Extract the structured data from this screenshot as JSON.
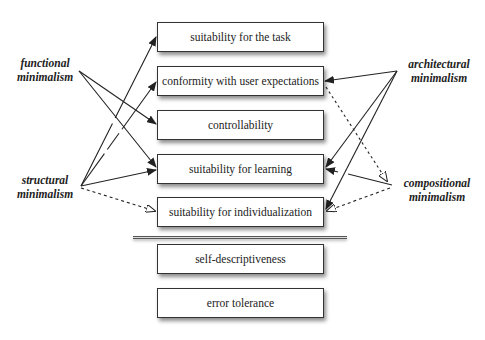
{
  "criteria": [
    {
      "id": "task",
      "label": "suitability for the task"
    },
    {
      "id": "conformity",
      "label": "conformity with user expectations"
    },
    {
      "id": "controllability",
      "label": "controllability"
    },
    {
      "id": "learning",
      "label": "suitability for learning"
    },
    {
      "id": "individualization",
      "label": "suitability for individualization"
    },
    {
      "id": "self_descriptiveness",
      "label": "self-descriptiveness"
    },
    {
      "id": "error_tolerance",
      "label": "error tolerance"
    }
  ],
  "minimalism_types": {
    "functional": {
      "line1": "functional",
      "line2": "minimalism"
    },
    "structural": {
      "line1": "structural",
      "line2": "minimalism"
    },
    "architectural": {
      "line1": "architectural",
      "line2": "minimalism"
    },
    "compositional": {
      "line1": "compositional",
      "line2": "minimalism"
    }
  },
  "relations": [
    {
      "from": "functional minimalism",
      "to": "controllability",
      "style": "solid"
    },
    {
      "from": "functional minimalism",
      "to": "suitability for learning",
      "style": "solid"
    },
    {
      "from": "structural minimalism",
      "to": "suitability for the task",
      "style": "solid"
    },
    {
      "from": "structural minimalism",
      "to": "conformity with user expectations",
      "style": "solid"
    },
    {
      "from": "structural minimalism",
      "to": "suitability for learning",
      "style": "solid"
    },
    {
      "from": "structural minimalism",
      "to": "suitability for individualization",
      "style": "dashed-hollow"
    },
    {
      "from": "architectural minimalism",
      "to": "conformity with user expectations",
      "style": "solid"
    },
    {
      "from": "architectural minimalism",
      "to": "suitability for learning",
      "style": "solid"
    },
    {
      "from": "architectural minimalism",
      "to": "suitability for individualization",
      "style": "solid"
    },
    {
      "from": "conformity with user expectations",
      "to": "compositional minimalism",
      "style": "dashed-hollow"
    },
    {
      "from": "compositional minimalism",
      "to": "suitability for learning",
      "style": "solid"
    },
    {
      "from": "compositional minimalism",
      "to": "suitability for individualization",
      "style": "dashed-hollow"
    }
  ]
}
